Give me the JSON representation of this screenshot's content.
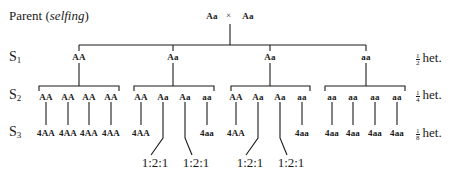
{
  "title": {
    "prefix": "Parent (",
    "italic": "selfing",
    "suffix": ")"
  },
  "parent_cross": {
    "left": "Aa",
    "symbol": "×",
    "right": "Aa"
  },
  "generations": {
    "s1": {
      "label": "S",
      "sub": "1",
      "genotypes": [
        "AA",
        "Aa",
        "Aa",
        "aa"
      ],
      "het": {
        "num": "1",
        "den": "2",
        "text": "het."
      }
    },
    "s2": {
      "label": "S",
      "sub": "2",
      "groups": [
        [
          "AA",
          "AA",
          "AA",
          "AA"
        ],
        [
          "AA",
          "Aa",
          "Aa",
          "aa"
        ],
        [
          "AA",
          "Aa",
          "Aa",
          "aa"
        ],
        [
          "aa",
          "aa",
          "aa",
          "aa"
        ]
      ],
      "het": {
        "num": "1",
        "den": "4",
        "text": "het."
      }
    },
    "s3": {
      "label": "S",
      "sub": "3",
      "groups": [
        [
          "4AA",
          "4AA",
          "4AA",
          "4AA"
        ],
        [
          "4AA",
          "1:2:1",
          "1:2:1",
          "4aa"
        ],
        [
          "4AA",
          "1:2:1",
          "1:2:1",
          "4aa"
        ],
        [
          "4aa",
          "4aa",
          "4aa",
          "4aa"
        ]
      ],
      "het": {
        "num": "1",
        "den": "8",
        "text": "het."
      }
    }
  }
}
